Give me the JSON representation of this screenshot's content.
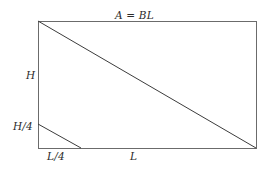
{
  "figure": {
    "kind": "geometry-diagram",
    "background_color": "#ffffff",
    "line_color": "#6b6b6b",
    "diagonal_color": "#3c3c3c",
    "label_color": "#2b2b2b",
    "labels": {
      "area": "A = BL",
      "height": "H",
      "height_quarter": "H/4",
      "length_quarter": "L/4",
      "length": "L"
    },
    "geometry": {
      "rect": {
        "x": 38,
        "y": 21,
        "width": 218,
        "height": 127
      },
      "main_diagonal": {
        "x1": 38,
        "y1": 21,
        "x2": 256,
        "y2": 148
      },
      "small_diagonal": {
        "x1": 38,
        "y1": 124,
        "x2": 81,
        "y2": 148
      }
    }
  }
}
